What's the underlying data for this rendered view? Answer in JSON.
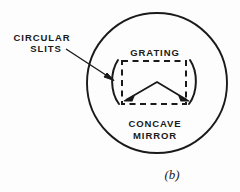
{
  "figure": {
    "caption": "(b)",
    "labels": {
      "circular_slits_line1": "CIRCULAR",
      "circular_slits_line2": "SLITS",
      "grating": "GRATING",
      "concave_mirror_line1": "CONCAVE",
      "concave_mirror_line2": "MIRROR"
    },
    "colors": {
      "ink": "#1a1a1a",
      "background": "#fdfdfd"
    }
  }
}
